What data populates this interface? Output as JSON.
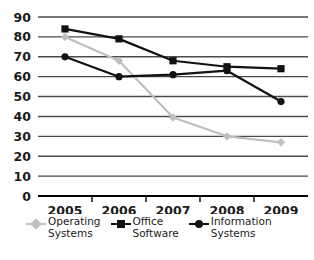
{
  "chart_data": {
    "type": "line",
    "title": "",
    "xlabel": "",
    "ylabel": "",
    "categories": [
      "2005",
      "2006",
      "2007",
      "2008",
      "2009"
    ],
    "ylim": [
      0,
      90
    ],
    "ytick_step": 10,
    "yticks": [
      "90",
      "80",
      "70",
      "60",
      "50",
      "40",
      "30",
      "20",
      "10",
      "0"
    ],
    "grid": true,
    "legend_position": "bottom",
    "series": [
      {
        "name": "Operating Systems",
        "label_line1": "Operating",
        "label_line2": "Systems",
        "color": "#bfbfbf",
        "marker": "diamond",
        "values": [
          80,
          68,
          39.5,
          30,
          27
        ]
      },
      {
        "name": "Office Software",
        "label_line1": "Office",
        "label_line2": "Software",
        "color": "#111111",
        "marker": "square",
        "values": [
          84,
          79,
          68,
          65,
          64
        ]
      },
      {
        "name": "Information Systems",
        "label_line1": "Information",
        "label_line2": "Systems",
        "color": "#111111",
        "marker": "circle",
        "values": [
          70,
          60,
          61,
          63,
          47.5
        ]
      }
    ]
  }
}
